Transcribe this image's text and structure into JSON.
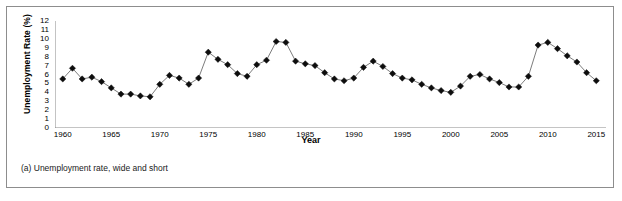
{
  "figure": {
    "caption": "(a) Unemployment rate, wide and short"
  },
  "colors": {
    "frame_border": "#8d8d8d",
    "axis": "#7a7a7a",
    "marker": "#0d0d0d",
    "line": "#5a5a5a",
    "background": "#ffffff",
    "text": "#000000"
  },
  "chart_data": {
    "type": "line",
    "title": "",
    "subtitle": "",
    "xlabel": "Year",
    "ylabel": "Unemployment Rate (%)",
    "xlim": [
      1959.2,
      2016.0
    ],
    "ylim": [
      0,
      12
    ],
    "grid": false,
    "legend": null,
    "marker": "diamond",
    "y_ticks": [
      0,
      1,
      2,
      3,
      4,
      5,
      6,
      7,
      8,
      9,
      10,
      11,
      12
    ],
    "y_tick_labels": [
      "0",
      "1",
      "2",
      "3",
      "4",
      "5",
      "6",
      "7",
      "8",
      "9",
      "10",
      "11",
      "12"
    ],
    "x_ticks": [
      1960,
      1965,
      1970,
      1975,
      1980,
      1985,
      1990,
      1995,
      2000,
      2005,
      2010,
      2015
    ],
    "x_tick_labels": [
      "1960",
      "1965",
      "1970",
      "1975",
      "1980",
      "1985",
      "1990",
      "1995",
      "2000",
      "2005",
      "2010",
      "2015"
    ],
    "x": [
      1960,
      1961,
      1962,
      1963,
      1964,
      1965,
      1966,
      1967,
      1968,
      1969,
      1970,
      1971,
      1972,
      1973,
      1974,
      1975,
      1976,
      1977,
      1978,
      1979,
      1980,
      1981,
      1982,
      1983,
      1984,
      1985,
      1986,
      1987,
      1988,
      1989,
      1990,
      1991,
      1992,
      1993,
      1994,
      1995,
      1996,
      1997,
      1998,
      1999,
      2000,
      2001,
      2002,
      2003,
      2004,
      2005,
      2006,
      2007,
      2008,
      2009,
      2010,
      2011,
      2012,
      2013,
      2014,
      2015
    ],
    "values": [
      5.5,
      6.7,
      5.5,
      5.7,
      5.2,
      4.5,
      3.8,
      3.8,
      3.6,
      3.5,
      4.9,
      5.9,
      5.6,
      4.9,
      5.6,
      8.5,
      7.7,
      7.1,
      6.1,
      5.8,
      7.1,
      7.6,
      9.7,
      9.6,
      7.5,
      7.2,
      7.0,
      6.2,
      5.5,
      5.3,
      5.6,
      6.8,
      7.5,
      6.9,
      6.1,
      5.6,
      5.4,
      4.9,
      4.5,
      4.2,
      4.0,
      4.7,
      5.8,
      6.0,
      5.5,
      5.1,
      4.6,
      4.6,
      5.8,
      9.3,
      9.6,
      8.9,
      8.1,
      7.4,
      6.2,
      5.3
    ]
  }
}
